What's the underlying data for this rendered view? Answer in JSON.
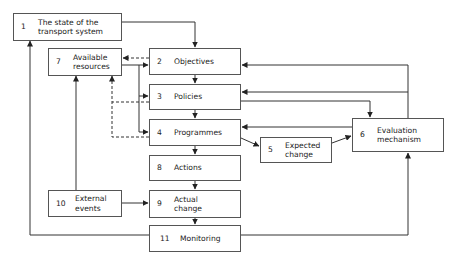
{
  "diagram": {
    "type": "flowchart",
    "nodes": [
      {
        "id": "1",
        "number": "1",
        "label": "The state of the\ntransport system"
      },
      {
        "id": "2",
        "number": "2",
        "label": "Objectives"
      },
      {
        "id": "3",
        "number": "3",
        "label": "Policies"
      },
      {
        "id": "4",
        "number": "4",
        "label": "Programmes"
      },
      {
        "id": "5",
        "number": "5",
        "label": "Expected\nchange"
      },
      {
        "id": "6",
        "number": "6",
        "label": "Evaluation\nmechanism"
      },
      {
        "id": "7",
        "number": "7",
        "label": "Available\nresources"
      },
      {
        "id": "8",
        "number": "8",
        "label": "Actions"
      },
      {
        "id": "9",
        "number": "9",
        "label": "Actual\nchange"
      },
      {
        "id": "10",
        "number": "10",
        "label": "External\nevents"
      },
      {
        "id": "11",
        "number": "11",
        "label": "Monitoring"
      }
    ],
    "edges": [
      {
        "from": "1",
        "to": "2",
        "style": "solid"
      },
      {
        "from": "2",
        "to": "3",
        "style": "solid"
      },
      {
        "from": "3",
        "to": "4",
        "style": "solid"
      },
      {
        "from": "4",
        "to": "8",
        "style": "solid"
      },
      {
        "from": "8",
        "to": "9",
        "style": "solid"
      },
      {
        "from": "9",
        "to": "11",
        "style": "solid"
      },
      {
        "from": "4",
        "to": "5",
        "style": "solid"
      },
      {
        "from": "5",
        "to": "6",
        "style": "solid"
      },
      {
        "from": "3",
        "to": "6",
        "style": "solid"
      },
      {
        "from": "6",
        "to": "2",
        "style": "solid"
      },
      {
        "from": "6",
        "to": "3",
        "style": "solid"
      },
      {
        "from": "6",
        "to": "4",
        "style": "solid"
      },
      {
        "from": "11",
        "to": "6",
        "style": "solid"
      },
      {
        "from": "11",
        "to": "1",
        "style": "solid"
      },
      {
        "from": "7",
        "to": "2",
        "style": "solid"
      },
      {
        "from": "7",
        "to": "3",
        "style": "solid"
      },
      {
        "from": "7",
        "to": "4",
        "style": "solid"
      },
      {
        "from": "10",
        "to": "9",
        "style": "solid"
      },
      {
        "from": "10",
        "to": "7",
        "style": "solid"
      },
      {
        "from": "2",
        "to": "7",
        "style": "dashed"
      },
      {
        "from": "3",
        "to": "7",
        "style": "dashed"
      },
      {
        "from": "4",
        "to": "7",
        "style": "dashed"
      }
    ]
  }
}
